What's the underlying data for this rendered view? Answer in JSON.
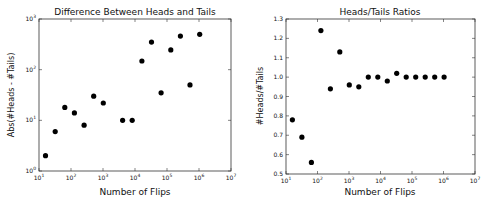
{
  "chart_data": [
    {
      "type": "scatter",
      "title": "Difference Between Heads and Tails",
      "xlabel": "Number of Flips",
      "ylabel": "Abs(#Heads - #Tails)",
      "xscale": "log",
      "yscale": "log",
      "xlim": [
        10,
        10000000
      ],
      "ylim": [
        1,
        1000
      ],
      "x_ticks": [
        "10^1",
        "10^2",
        "10^3",
        "10^4",
        "10^5",
        "10^6",
        "10^7"
      ],
      "y_ticks": [
        "10^0",
        "10^1",
        "10^2",
        "10^3"
      ],
      "grid": false,
      "x": [
        16,
        32,
        64,
        128,
        256,
        512,
        1024,
        4096,
        8192,
        16384,
        32768,
        65536,
        131072,
        262144,
        524288,
        1048576
      ],
      "y": [
        2,
        6,
        18,
        14,
        8,
        30,
        22,
        10,
        10,
        148,
        350,
        35,
        245,
        460,
        50,
        500
      ]
    },
    {
      "type": "scatter",
      "title": "Heads/Tails Ratios",
      "xlabel": "Number of Flips",
      "ylabel": "#Heads/#Tails",
      "xscale": "log",
      "yscale": "linear",
      "xlim": [
        10,
        10000000
      ],
      "ylim": [
        0.5,
        1.3
      ],
      "x_ticks": [
        "10^1",
        "10^2",
        "10^3",
        "10^4",
        "10^5",
        "10^6",
        "10^7"
      ],
      "y_ticks": [
        "0.5",
        "0.6",
        "0.7",
        "0.8",
        "0.9",
        "1.0",
        "1.1",
        "1.2",
        "1.3"
      ],
      "grid": false,
      "x": [
        16,
        32,
        64,
        128,
        256,
        512,
        1024,
        2048,
        4096,
        8192,
        16384,
        32768,
        65536,
        131072,
        262144,
        524288,
        1048576
      ],
      "y": [
        0.78,
        0.69,
        0.56,
        1.24,
        0.94,
        1.13,
        0.96,
        0.95,
        1.0,
        1.0,
        0.98,
        1.02,
        1.0,
        1.0,
        1.0,
        1.0,
        1.0
      ]
    }
  ],
  "charts": {
    "left": {
      "title": "Difference Between Heads and Tails",
      "xlabel": "Number of Flips",
      "ylabel": "Abs(#Heads - #Tails)"
    },
    "right": {
      "title": "Heads/Tails Ratios",
      "xlabel": "Number of Flips",
      "ylabel": "#Heads/#Tails"
    }
  }
}
